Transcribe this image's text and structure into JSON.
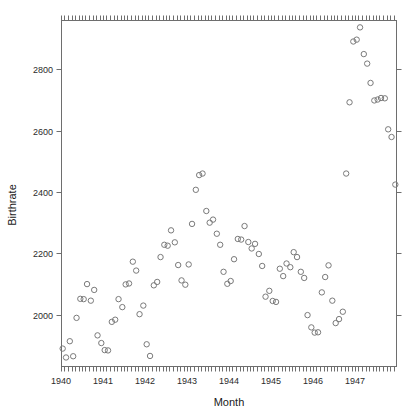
{
  "chart_data": {
    "type": "scatter",
    "title": "",
    "xlabel": "Month",
    "ylabel": "Birthrate",
    "xlim": [
      1940.0,
      1948.0
    ],
    "ylim": [
      1830,
      2960
    ],
    "grid": false,
    "legend": null,
    "xtick_labels": [
      "1940",
      "1941",
      "1942",
      "1943",
      "1944",
      "1945",
      "1946",
      "1947"
    ],
    "xtick_values": [
      1940,
      1941,
      1942,
      1943,
      1944,
      1945,
      1946,
      1947
    ],
    "ytick_labels": [
      "2000",
      "2200",
      "2400",
      "2600",
      "2800"
    ],
    "ytick_values": [
      2000,
      2200,
      2400,
      2600,
      2800
    ],
    "minor_tick_interval_months": 1,
    "marker": "open-circle",
    "marker_color": "#7a7a7a",
    "x": [
      1940.04,
      1940.12,
      1940.21,
      1940.29,
      1940.37,
      1940.46,
      1940.54,
      1940.62,
      1940.71,
      1940.79,
      1940.87,
      1940.96,
      1941.04,
      1941.12,
      1941.21,
      1941.29,
      1941.37,
      1941.46,
      1941.54,
      1941.62,
      1941.71,
      1941.79,
      1941.87,
      1941.96,
      1942.04,
      1942.12,
      1942.21,
      1942.29,
      1942.37,
      1942.46,
      1942.54,
      1942.62,
      1942.71,
      1942.79,
      1942.87,
      1942.96,
      1943.04,
      1943.12,
      1943.21,
      1943.29,
      1943.37,
      1943.46,
      1943.54,
      1943.62,
      1943.71,
      1943.79,
      1943.87,
      1943.96,
      1944.04,
      1944.12,
      1944.21,
      1944.29,
      1944.37,
      1944.46,
      1944.54,
      1944.62,
      1944.71,
      1944.79,
      1944.87,
      1944.96,
      1945.04,
      1945.12,
      1945.21,
      1945.29,
      1945.37,
      1945.46,
      1945.54,
      1945.62,
      1945.71,
      1945.79,
      1945.87,
      1945.96,
      1946.04,
      1946.12,
      1946.21,
      1946.29,
      1946.37,
      1946.46,
      1946.54,
      1946.62,
      1946.71,
      1946.79,
      1946.87,
      1946.96,
      1947.04,
      1947.12,
      1947.21,
      1947.29,
      1947.37,
      1947.46,
      1947.54,
      1947.62,
      1947.71,
      1947.79,
      1947.87,
      1947.96
    ],
    "y": [
      1890,
      1861,
      1914,
      1865,
      1990,
      2052,
      2051,
      2100,
      2046,
      2081,
      1933,
      1908,
      1885,
      1884,
      1977,
      1984,
      2051,
      2025,
      2099,
      2102,
      2173,
      2144,
      2002,
      2030,
      1904,
      1866,
      2096,
      2107,
      2188,
      2228,
      2225,
      2275,
      2236,
      2162,
      2112,
      2098,
      2164,
      2296,
      2407,
      2455,
      2460,
      2338,
      2300,
      2310,
      2264,
      2228,
      2140,
      2101,
      2110,
      2181,
      2247,
      2245,
      2289,
      2237,
      2216,
      2231,
      2198,
      2159,
      2059,
      2078,
      2045,
      2042,
      2150,
      2126,
      2167,
      2155,
      2204,
      2188,
      2140,
      2120,
      1999,
      1959,
      1942,
      1943,
      2073,
      2123,
      2161,
      2046,
      1973,
      1986,
      2010,
      2460,
      2692,
      2890,
      2896,
      2936,
      2849,
      2818,
      2755,
      2698,
      2701,
      2706,
      2705,
      2604,
      2579,
      2424
    ]
  },
  "figure": {
    "plot_left": 61,
    "plot_right": 397,
    "plot_top": 20,
    "plot_bottom": 367
  }
}
